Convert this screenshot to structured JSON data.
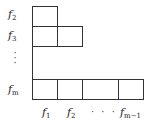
{
  "diagram": {
    "row_labels": [
      {
        "base": "f",
        "sub": "2"
      },
      {
        "base": "f",
        "sub": "3"
      },
      {
        "base": "f",
        "sub": "m"
      }
    ],
    "vertical_ellipsis": "⋮",
    "column_labels": [
      {
        "base": "f",
        "sub": "1"
      },
      {
        "base": "f",
        "sub": "2"
      },
      {
        "base": "f",
        "sub": "m−1"
      }
    ],
    "horizontal_ellipsis": "· · ·",
    "rows": [
      {
        "label_index": 0,
        "cells": 1
      },
      {
        "label_index": 1,
        "cells": 2
      },
      {
        "label_index": 2,
        "cells": 4
      }
    ]
  }
}
